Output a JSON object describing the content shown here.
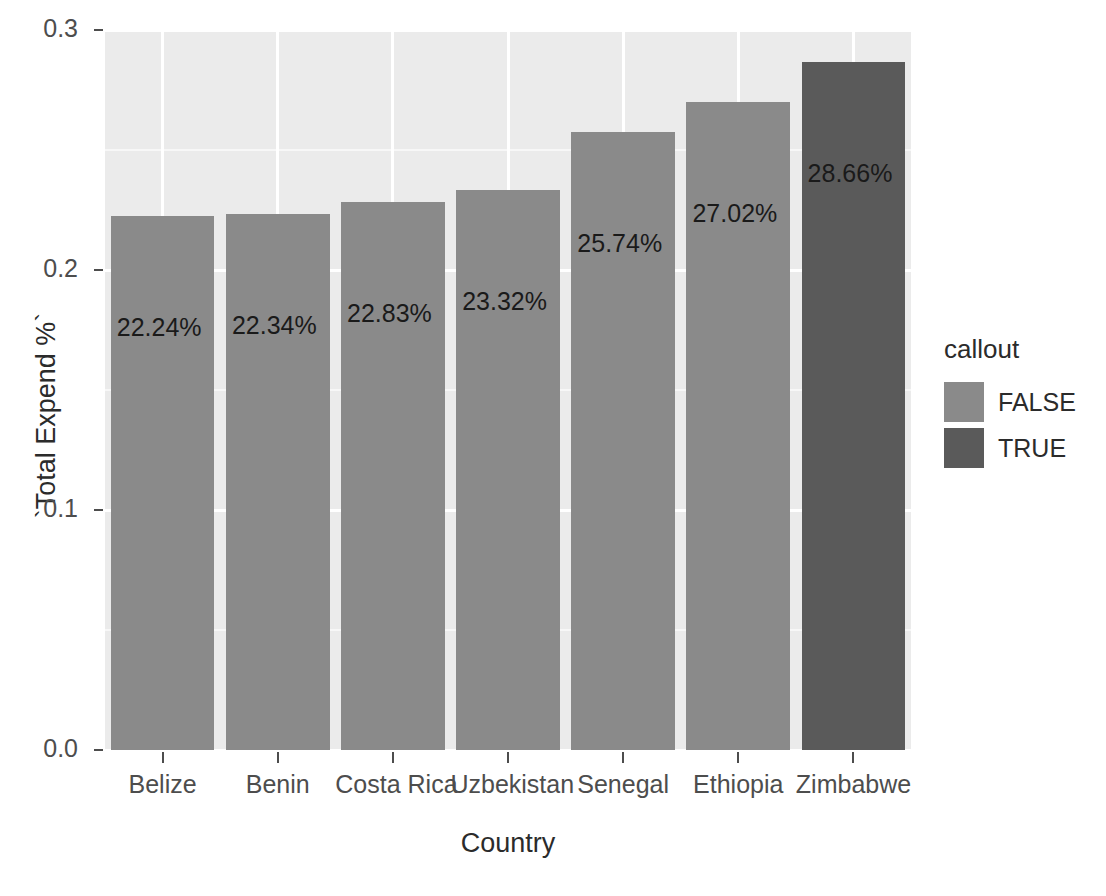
{
  "chart_data": {
    "type": "bar",
    "title": "",
    "subtitle": "",
    "xlabel": "Country",
    "ylabel": "`Total Expend %`",
    "categories": [
      "Belize",
      "Benin",
      "Costa Rica",
      "Uzbekistan",
      "Senegal",
      "Ethiopia",
      "Zimbabwe"
    ],
    "values": [
      0.2224,
      0.2234,
      0.2283,
      0.2332,
      0.2574,
      0.2702,
      0.2866
    ],
    "data_labels": [
      "22.24%",
      "22.34%",
      "22.83%",
      "23.32%",
      "25.74%",
      "27.02%",
      "28.66%"
    ],
    "series": [
      {
        "name": "`Total Expend %`",
        "values": [
          0.2224,
          0.2234,
          0.2283,
          0.2332,
          0.2574,
          0.2702,
          0.2866
        ],
        "callout": [
          false,
          false,
          false,
          false,
          false,
          false,
          true
        ]
      }
    ],
    "ylim": [
      0.0,
      0.3
    ],
    "xlim": [
      0,
      7
    ],
    "y_ticks": [
      "0.0",
      "0.1",
      "0.2",
      "0.3"
    ],
    "y_tick_values": [
      0.0,
      0.1,
      0.2,
      0.3
    ],
    "y_minor_tick_values": [
      0.05,
      0.15,
      0.25
    ],
    "grid": true,
    "grid_color": "#ffffff",
    "panel_background": "#ebebeb",
    "legend_position": "right",
    "legend": {
      "title": "callout",
      "entries": [
        {
          "label": "FALSE",
          "color": "#8a8a8a"
        },
        {
          "label": "TRUE",
          "color": "#5a5a5a"
        }
      ]
    },
    "colors": {
      "false_fill": "#8a8a8a",
      "true_fill": "#5a5a5a",
      "axis_text": "#4d4d4d",
      "axis_title": "#2b2b2b",
      "label_text": "#1a1a1a"
    }
  }
}
